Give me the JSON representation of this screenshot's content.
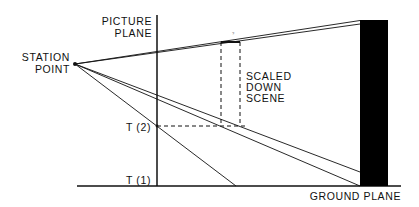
{
  "diagram": {
    "labels": {
      "picture_plane_line1": "PICTURE",
      "picture_plane_line2": "PLANE",
      "station_point_line1": "STATION",
      "station_point_line2": "POINT",
      "scaled_line1": "SCALED",
      "scaled_line2": "DOWN",
      "scaled_line3": "SCENE",
      "t2": "T (2)",
      "t1": "T (1)",
      "ground_plane": "GROUND PLANE",
      "tiny_mark": "?"
    },
    "colors": {
      "ink": "#111111",
      "background": "#ffffff",
      "building": "#000000"
    }
  }
}
